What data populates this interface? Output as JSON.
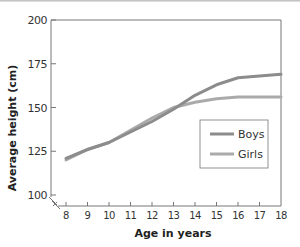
{
  "chart_data": {
    "type": "line",
    "title": "",
    "xlabel": "Age in years",
    "ylabel": "Average height (cm)",
    "x": [
      8,
      9,
      10,
      11,
      12,
      13,
      14,
      15,
      16,
      17,
      18
    ],
    "xticks": [
      "8",
      "9",
      "10",
      "11",
      "12",
      "13",
      "14",
      "15",
      "16",
      "17",
      "18"
    ],
    "yticks": [
      "100",
      "125",
      "150",
      "175",
      "200"
    ],
    "ylim": [
      100,
      200
    ],
    "xlim": [
      8,
      18
    ],
    "axis_break": true,
    "grid": false,
    "legend_position": "lower right (inside plot)",
    "series": [
      {
        "name": "Boys",
        "color": "#8c8c8c",
        "values": [
          121,
          126,
          130,
          136,
          142,
          149,
          157,
          163,
          167,
          168,
          169
        ]
      },
      {
        "name": "Girls",
        "color": "#aaaaaa",
        "values": [
          120,
          126,
          130,
          137,
          144,
          150,
          153,
          155,
          156,
          156,
          156
        ]
      }
    ]
  },
  "legend": {
    "items": [
      {
        "label": "Boys",
        "color": "#8c8c8c"
      },
      {
        "label": "Girls",
        "color": "#aaaaaa"
      }
    ]
  }
}
